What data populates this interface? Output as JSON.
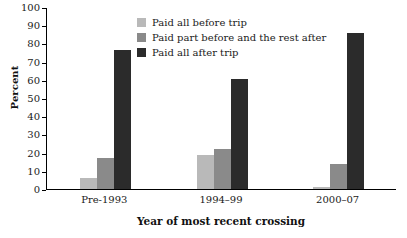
{
  "chart_data": {
    "type": "bar",
    "title": "",
    "xlabel": "Year of most recent crossing",
    "ylabel": "Percent",
    "categories": [
      "Pre-1993",
      "1994–99",
      "2000–07"
    ],
    "series": [
      {
        "name": "Paid all before trip",
        "color": "#b9b9b9",
        "values": [
          6,
          19,
          1
        ]
      },
      {
        "name": "Paid part before and the rest after",
        "color": "#8a8a8a",
        "values": [
          17,
          22,
          14
        ]
      },
      {
        "name": "Paid all after trip",
        "color": "#2b2b2b",
        "values": [
          77,
          61,
          86
        ]
      }
    ],
    "ylim": [
      0,
      100
    ],
    "yticks": [
      0,
      10,
      20,
      30,
      40,
      50,
      60,
      70,
      80,
      90,
      100
    ],
    "ytick_labels": [
      "0",
      "10",
      "20",
      "30",
      "40",
      "50",
      "60",
      "70",
      "80",
      "90",
      "100"
    ],
    "grid": false,
    "legend_position": "top-center"
  }
}
